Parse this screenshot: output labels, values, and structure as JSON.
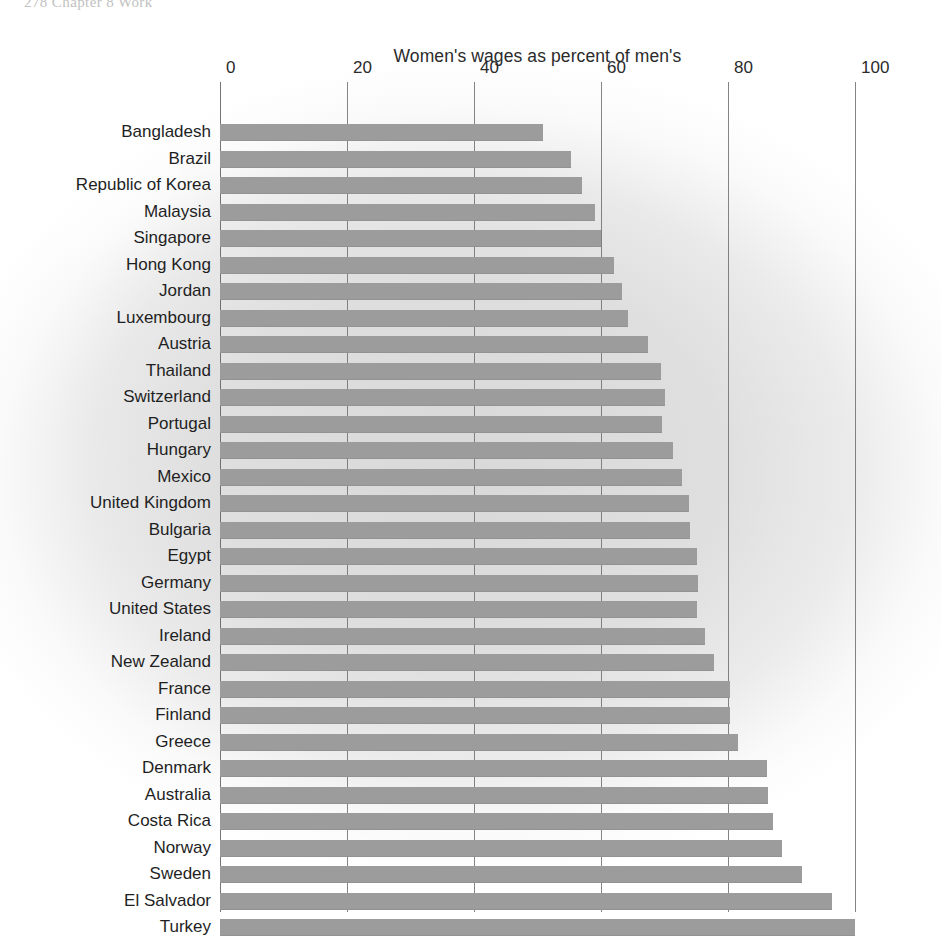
{
  "page": {
    "header_crop_text": "278     Chapter 8  Work"
  },
  "chart_data": {
    "type": "bar",
    "orientation": "horizontal",
    "title": "Women's wages as percent of men's",
    "xlabel": "",
    "ylabel": "",
    "xlim": [
      0,
      100
    ],
    "ticks": [
      0,
      20,
      40,
      60,
      80,
      100
    ],
    "tick_labels": [
      "0",
      "20",
      "40",
      "60",
      "80",
      "100"
    ],
    "grid": true,
    "legend": "none",
    "bar_color": "#9c9c9c",
    "background_color": "#e0e0e0",
    "categories": [
      "Bangladesh",
      "Brazil",
      "Republic of Korea",
      "Malaysia",
      "Singapore",
      "Hong Kong",
      "Jordan",
      "Luxembourg",
      "Austria",
      "Thailand",
      "Switzerland",
      "Portugal",
      "Hungary",
      "Mexico",
      "United Kingdom",
      "Bulgaria",
      "Egypt",
      "Germany",
      "United States",
      "Ireland",
      "New Zealand",
      "France",
      "Finland",
      "Greece",
      "Denmark",
      "Australia",
      "Costa Rica",
      "Norway",
      "Sweden",
      "El Salvador",
      "Turkey"
    ],
    "values": [
      50.9,
      55.2,
      57.0,
      59.0,
      60.0,
      62.0,
      63.3,
      64.3,
      67.4,
      69.4,
      70.1,
      69.6,
      71.3,
      72.8,
      73.9,
      74.0,
      75.1,
      75.3,
      75.1,
      76.4,
      77.8,
      80.3,
      80.3,
      81.6,
      86.1,
      86.3,
      87.1,
      88.5,
      91.7,
      96.4,
      100.0
    ]
  }
}
